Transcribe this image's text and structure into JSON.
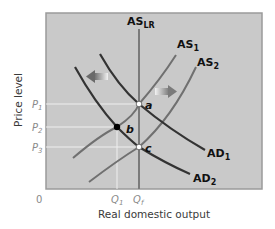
{
  "diagram": {
    "x_axis_title": "Real domestic output",
    "y_axis_title": "Price level",
    "origin_label": "0",
    "x_ticks": [
      {
        "label": "Q",
        "sub": "1"
      },
      {
        "label": "Q",
        "sub": "f"
      }
    ],
    "y_ticks": [
      {
        "label": "P",
        "sub": "1"
      },
      {
        "label": "P",
        "sub": "2"
      },
      {
        "label": "P",
        "sub": "3"
      }
    ],
    "curves": [
      {
        "name": "AS",
        "sub": "LR",
        "type": "vertical"
      },
      {
        "name": "AS",
        "sub": "1",
        "type": "upward"
      },
      {
        "name": "AS",
        "sub": "2",
        "type": "upward"
      },
      {
        "name": "AD",
        "sub": "1",
        "type": "downward"
      },
      {
        "name": "AD",
        "sub": "2",
        "type": "downward"
      }
    ],
    "points": [
      {
        "label": "a",
        "x": "Qf",
        "y": "P1",
        "style": "hollow"
      },
      {
        "label": "b",
        "x": "Q1",
        "y": "P2",
        "style": "filled"
      },
      {
        "label": "c",
        "x": "Qf",
        "y": "P3",
        "style": "hollow"
      }
    ],
    "arrows": [
      {
        "direction": "left",
        "meaning": "AD shifts left"
      },
      {
        "direction": "right",
        "meaning": "AS shifts right"
      }
    ],
    "colors": {
      "plot_bg": "#c9c9c9",
      "plot_border": "#8c8c8c",
      "ad_curve": "#2e2e2e",
      "as_curve": "#6e6e6e",
      "guide_line": "#ececec",
      "arrow": "#7a7a7a"
    }
  }
}
